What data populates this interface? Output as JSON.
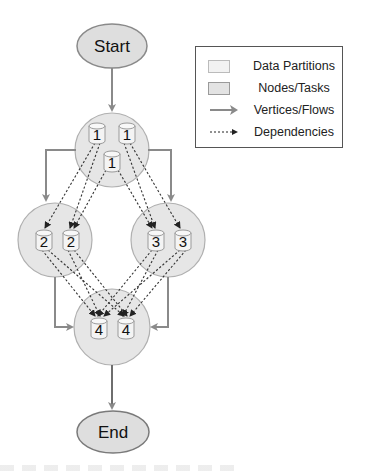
{
  "diagram": {
    "start_label": "Start",
    "end_label": "End",
    "stages": [
      {
        "id": "1",
        "partitions": [
          "1",
          "1",
          "1"
        ]
      },
      {
        "id": "2",
        "partitions": [
          "2",
          "2"
        ]
      },
      {
        "id": "3",
        "partitions": [
          "3",
          "3"
        ]
      },
      {
        "id": "4",
        "partitions": [
          "4",
          "4"
        ]
      }
    ],
    "flows": [
      {
        "from": "Start",
        "to": "1"
      },
      {
        "from": "1",
        "to": "2"
      },
      {
        "from": "1",
        "to": "3"
      },
      {
        "from": "2",
        "to": "4"
      },
      {
        "from": "3",
        "to": "4"
      },
      {
        "from": "4",
        "to": "End"
      }
    ],
    "dependencies": [
      {
        "from": "1",
        "to": "2"
      },
      {
        "from": "1",
        "to": "3"
      },
      {
        "from": "2",
        "to": "4"
      },
      {
        "from": "3",
        "to": "4"
      }
    ],
    "colors": {
      "node_fill": "#e6e6e6",
      "node_stroke": "#aaaaaa",
      "terminal_fill": "#dedede",
      "terminal_stroke": "#888888",
      "partition_fill": "#f4f4f4",
      "flow_arrow": "#8a8a8a",
      "dependency": "#333333"
    }
  },
  "legend": {
    "items": [
      {
        "label": "Data Partitions",
        "symbol": "partition-swatch"
      },
      {
        "label": "Nodes/Tasks",
        "symbol": "node-swatch"
      },
      {
        "label": "Vertices/Flows",
        "symbol": "solid-arrow"
      },
      {
        "label": "Dependencies",
        "symbol": "dotted-arrow"
      }
    ]
  }
}
